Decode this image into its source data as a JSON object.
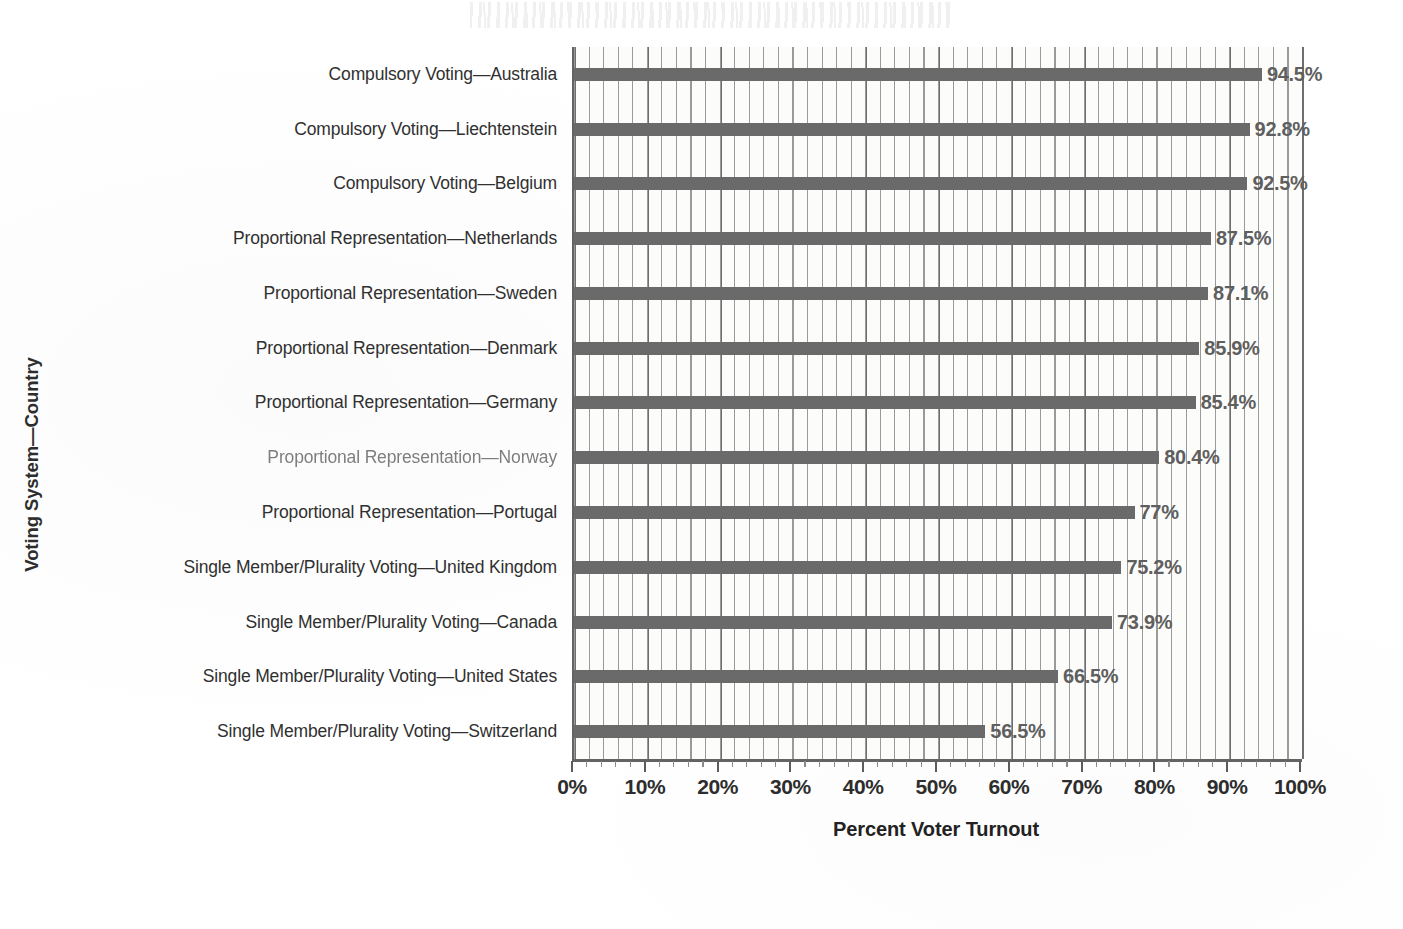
{
  "chart_data": {
    "type": "bar",
    "orientation": "horizontal",
    "title": "",
    "xlabel": "Percent Voter Turnout",
    "ylabel": "Voting System—Country",
    "xlim": [
      0,
      100
    ],
    "grid": "vertical major every 10%, minor every 2%",
    "legend": "none",
    "x_tick_labels": [
      "0%",
      "10%",
      "20%",
      "30%",
      "40%",
      "50%",
      "60%",
      "70%",
      "80%",
      "90%",
      "100%"
    ],
    "x_tick_values": [
      0,
      10,
      20,
      30,
      40,
      50,
      60,
      70,
      80,
      90,
      100
    ],
    "categories": [
      "Compulsory Voting—Australia",
      "Compulsory Voting—Liechtenstein",
      "Compulsory Voting—Belgium",
      "Proportional Representation—Netherlands",
      "Proportional Representation—Sweden",
      "Proportional Representation—Denmark",
      "Proportional Representation—Germany",
      "Proportional Representation—Norway",
      "Proportional Representation—Portugal",
      "Single Member/Plurality Voting—United Kingdom",
      "Single Member/Plurality Voting—Canada",
      "Single Member/Plurality Voting—United States",
      "Single Member/Plurality Voting—Switzerland"
    ],
    "values": [
      94.5,
      92.8,
      92.5,
      87.5,
      87.1,
      85.9,
      85.4,
      80.4,
      77,
      75.2,
      73.9,
      66.5,
      56.5
    ],
    "data_labels": [
      "94.5%",
      "92.8%",
      "92.5%",
      "87.5%",
      "87.1%",
      "85.9%",
      "85.4%",
      "80.4%",
      "77%",
      "75.2%",
      "73.9%",
      "66.5%",
      "56.5%"
    ],
    "colors": {
      "bar": "#6a6a6a",
      "data_label": "#5f5f5f",
      "axis": "#636363",
      "major_gridline": "#6e6e6e",
      "minor_gridline": "#9a9a9a",
      "plot_background": "#fcfcfb",
      "text": "#2d2d2d"
    }
  }
}
